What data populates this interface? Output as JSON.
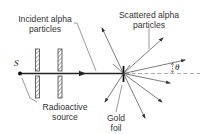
{
  "diagram": {
    "labels": {
      "incident_line1": "Incident alpha",
      "incident_line2": "particles",
      "scattered_line1": "Scattered alpha",
      "scattered_line2": "particles",
      "source_symbol": "S",
      "source_line1": "Radioactive",
      "source_line2": "source",
      "foil_line1": "Gold",
      "foil_line2": "foil",
      "angle_symbol": "θ"
    },
    "colors": {
      "line": "#333333",
      "text": "#333333",
      "dashed": "#999999"
    }
  }
}
